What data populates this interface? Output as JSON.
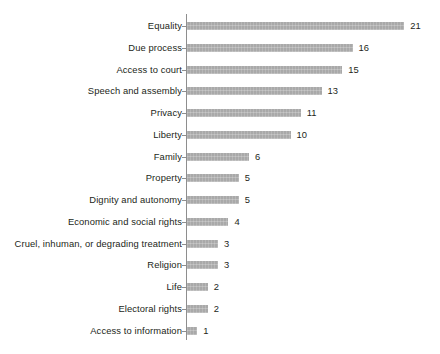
{
  "chart_data": {
    "type": "bar",
    "orientation": "horizontal",
    "title": "",
    "subtitle": "",
    "xlabel": "",
    "ylabel": "",
    "xlim": [
      0,
      21
    ],
    "grid": false,
    "legend": null,
    "bar_color": "#a9a9a9",
    "text_color": "#231f20",
    "axis_color": "#8e8e8e",
    "background": "#ffffff",
    "value_labels_shown": true,
    "axis_tick_labels_shown": false,
    "categories": [
      "Equality",
      "Due process",
      "Access to court",
      "Speech and assembly",
      "Privacy",
      "Liberty",
      "Family",
      "Property",
      "Dignity and autonomy",
      "Economic and social rights",
      "Cruel, inhuman, or degrading treatment",
      "Religion",
      "Life",
      "Electoral rights",
      "Access to information"
    ],
    "values": [
      21,
      16,
      15,
      13,
      11,
      10,
      6,
      5,
      5,
      4,
      3,
      3,
      2,
      2,
      1
    ],
    "value_label_text": [
      "21",
      "16",
      "15",
      "13",
      "11",
      "10",
      "6",
      "5",
      "5",
      "4",
      "3",
      "3",
      "2",
      "2",
      "1"
    ]
  }
}
